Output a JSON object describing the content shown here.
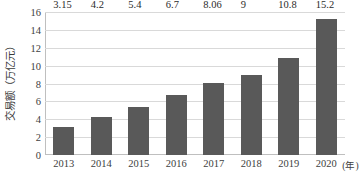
{
  "chart_data": {
    "type": "bar",
    "title": "",
    "subtitle": "",
    "xlabel": "年",
    "ylabel": "交易额（万亿元）",
    "x_unit_note": "(年)",
    "categories": [
      "2013",
      "2014",
      "2015",
      "2016",
      "2017",
      "2018",
      "2019",
      "2020"
    ],
    "values": [
      3.15,
      4.2,
      5.4,
      6.7,
      8.06,
      9,
      10.8,
      15.2
    ],
    "value_labels": [
      "3.15",
      "4.2",
      "5.4",
      "6.7",
      "8.06",
      "9",
      "10.8",
      "15.2"
    ],
    "ylim": [
      0,
      16
    ],
    "y_ticks": [
      0,
      2,
      4,
      6,
      8,
      10,
      12,
      14,
      16
    ],
    "y_tick_labels": [
      "0",
      "2",
      "4",
      "6",
      "8",
      "10",
      "12",
      "14",
      "16"
    ],
    "grid": "horizontal",
    "legend": "none",
    "series": [
      {
        "name": "交易额",
        "values": [
          3.15,
          4.2,
          5.4,
          6.7,
          8.06,
          9,
          10.8,
          15.2
        ]
      }
    ]
  },
  "style": {
    "bar_color": "#595959",
    "gridline_color": "#d9d9d9",
    "axis_color": "#bfbfbf",
    "label_color": "#2b2b2b",
    "tick_color": "#404040",
    "background": "#ffffff"
  }
}
